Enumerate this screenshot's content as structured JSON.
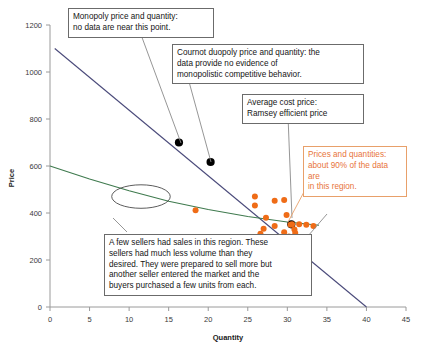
{
  "chart_data": {
    "type": "scatter",
    "title": "",
    "xlabel": "Quantity",
    "ylabel": "Price",
    "xlim": [
      0,
      45
    ],
    "ylim": [
      0,
      1200
    ],
    "xticks": [
      0,
      5,
      10,
      15,
      20,
      25,
      30,
      35,
      40,
      45
    ],
    "yticks": [
      0,
      200,
      400,
      600,
      800,
      1000,
      1200
    ],
    "grid": false,
    "legend": "none",
    "series": [
      {
        "name": "Demand curve",
        "type": "line",
        "color": "#4a4a7a",
        "points": [
          [
            0.6,
            1100
          ],
          [
            40.0,
            0
          ]
        ]
      },
      {
        "name": "Average cost curve",
        "type": "line",
        "color": "#3f7a4e",
        "points": [
          [
            0,
            600
          ],
          [
            5,
            545
          ],
          [
            10,
            495
          ],
          [
            15,
            450
          ],
          [
            20,
            415
          ],
          [
            25,
            385
          ],
          [
            30,
            362
          ],
          [
            34,
            348
          ]
        ]
      },
      {
        "name": "Key price-quantity points",
        "type": "scatter",
        "color": "#000000",
        "points": [
          [
            16.3,
            700
          ],
          [
            20.3,
            617
          ],
          [
            30.5,
            352
          ]
        ],
        "labels": [
          "Monopoly",
          "Cournot duopoly",
          "Average cost / Ramsey"
        ]
      },
      {
        "name": "Observed market data",
        "type": "scatter",
        "color": "#ef6c17",
        "points": [
          [
            18.4,
            412
          ],
          [
            25.9,
            470
          ],
          [
            25.9,
            432
          ],
          [
            27.3,
            380
          ],
          [
            28.4,
            452
          ],
          [
            29.6,
            455
          ],
          [
            29.9,
            392
          ],
          [
            27.0,
            333
          ],
          [
            28.4,
            345
          ],
          [
            30.4,
            350
          ],
          [
            30.6,
            352
          ],
          [
            30.9,
            330
          ],
          [
            31.5,
            352
          ],
          [
            32.4,
            350
          ],
          [
            33.3,
            345
          ],
          [
            31.0,
            315
          ],
          [
            29.6,
            318
          ],
          [
            30.2,
            300
          ],
          [
            26.6,
            312
          ]
        ]
      }
    ],
    "annotations": [
      {
        "name": "monopoly",
        "text": "Monopoly price and quantity:\nno data are near this point.",
        "color": "#151515",
        "target": [
          16.3,
          700
        ]
      },
      {
        "name": "cournot",
        "text": "Cournot duopoly price and quantity: the\ndata provide no evidence of\nmonopolistic competitive behavior.",
        "color": "#151515",
        "target": [
          20.3,
          617
        ]
      },
      {
        "name": "average-cost",
        "text": "Average cost price:\nRamsey efficient price",
        "color": "#151515",
        "target": [
          30.5,
          352
        ]
      },
      {
        "name": "data-region",
        "text": "Prices and quantities:\nabout 90% of the data are\nin this region.",
        "color": "#e8743b",
        "target": [
          30.0,
          350
        ]
      },
      {
        "name": "few-sellers",
        "text": "A few sellers had sales in this region.  These\nsellers had much less volume than they\ndesired.  They were prepared to sell more but\nanother seller entered the market and the\nbuyers purchased a  few units from each.",
        "color": "#151515",
        "target": [
          11.0,
          450
        ]
      }
    ],
    "shapes": [
      {
        "name": "low-volume-region-ellipse",
        "type": "ellipse",
        "center": [
          11.5,
          470
        ],
        "rx": 3.7,
        "ry": 50,
        "stroke": "#4a4a4a"
      }
    ]
  },
  "axes": {
    "x": {
      "title": "Quantity",
      "ticks": [
        "0",
        "5",
        "10",
        "15",
        "20",
        "25",
        "30",
        "35",
        "40",
        "45"
      ]
    },
    "y": {
      "title": "Price",
      "ticks": [
        "0",
        "200",
        "400",
        "600",
        "800",
        "1000",
        "1200"
      ]
    }
  },
  "callouts": {
    "monopoly": "Monopoly price and quantity:\nno data are near this point.",
    "cournot": "Cournot duopoly price and quantity: the\ndata provide no evidence of\nmonopolistic competitive behavior.",
    "average_cost": "Average cost price:\nRamsey efficient price",
    "data_region": "Prices and quantities:\nabout 90% of the data are\nin this region.",
    "few_sellers": "A few sellers had sales in this region.  These\nsellers had much less volume than they\ndesired.  They were prepared to sell more but\nanother seller entered the market and the\nbuyers purchased a  few units from each."
  },
  "colors": {
    "demand_line": "#4a4a7a",
    "cost_curve": "#3f7a4e",
    "data_points": "#ef6c17",
    "key_points": "#000000",
    "callout_border": "#6b6b6b",
    "callout_orange": "#e8a06a",
    "axis": "#8a8a8a"
  }
}
